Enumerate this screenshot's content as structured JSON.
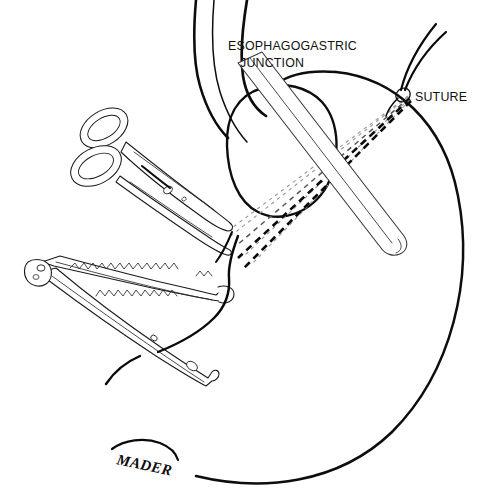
{
  "figure": {
    "background_color": "#ffffff",
    "ink_color": "#0d0d0d",
    "width": 485,
    "height": 495
  },
  "labels": {
    "egj_line1": "ESOPHAGOGASTRIC",
    "egj_line2": "JUNCTION",
    "suture": "SUTURE"
  },
  "signature": {
    "artist": "MADER"
  },
  "anatomy": {
    "esophagus_name": "esophagus",
    "junction_name": "esophagogastric-junction",
    "stomach_name": "stomach-fundus"
  },
  "instruments": [
    {
      "name": "surgical-scissors",
      "label": "scissors"
    },
    {
      "name": "hemostat-clamp",
      "label": "clamp"
    },
    {
      "name": "bougie-dilator",
      "label": "bougie"
    }
  ],
  "suture_lines": {
    "bold_count": 2,
    "faint_count": 4,
    "knot_label": "suture-knot"
  }
}
